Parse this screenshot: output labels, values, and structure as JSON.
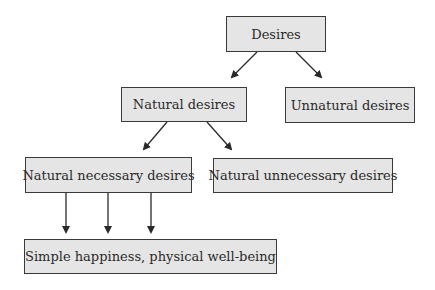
{
  "diagram": {
    "type": "tree",
    "nodes": [
      {
        "id": "desires",
        "label": "Desires"
      },
      {
        "id": "natural",
        "label": "Natural desires"
      },
      {
        "id": "unnatural",
        "label": "Unnatural desires"
      },
      {
        "id": "natural_necessary",
        "label": "Natural necessary desires"
      },
      {
        "id": "natural_unnecessary",
        "label": "Natural unnecessary desires"
      },
      {
        "id": "simple_happiness",
        "label": "Simple happiness, physical well-being"
      }
    ],
    "edges": [
      {
        "from": "desires",
        "to": "natural"
      },
      {
        "from": "desires",
        "to": "unnatural"
      },
      {
        "from": "natural",
        "to": "natural_necessary"
      },
      {
        "from": "natural",
        "to": "natural_unnecessary"
      },
      {
        "from": "natural_necessary",
        "to": "simple_happiness"
      },
      {
        "from": "natural_necessary",
        "to": "simple_happiness"
      },
      {
        "from": "natural_necessary",
        "to": "simple_happiness"
      }
    ],
    "colors": {
      "box_fill": "#e5e5e5",
      "box_border": "#3a3a3a",
      "arrow": "#2a2a2a"
    }
  }
}
